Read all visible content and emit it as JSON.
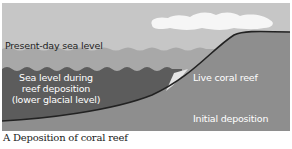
{
  "figure": {
    "caption": "A  Deposition of coral reef",
    "labels": {
      "present_sea_level": "Present-day sea level",
      "glacial_sea_level_line1": "Sea level during",
      "glacial_sea_level_line2": "reef deposition",
      "glacial_sea_level_line3": "(lower glacial level)",
      "live_coral_reef": "Live coral reef",
      "initial_deposition": "Initial deposition"
    },
    "colors": {
      "sky": "#c6c6c6",
      "present_sea": "#a8a8a8",
      "glacial_sea": "#5c5c5c",
      "land": "#8e8e8e",
      "coral": "#e4e4e4",
      "cloud": "#f6f6f6",
      "outline": "#222222"
    }
  }
}
